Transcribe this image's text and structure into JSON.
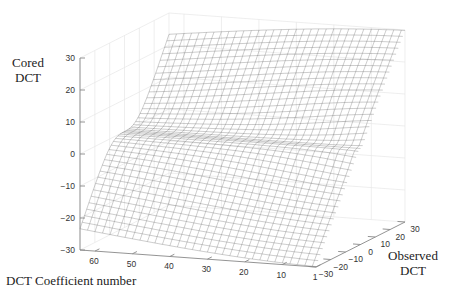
{
  "chart_data": {
    "type": "surface3d",
    "title": "",
    "zlabel": "Cored DCT",
    "xlabel": "DCT Coefficient number",
    "ylabel": "Observed DCT",
    "z_ticks": [
      30,
      20,
      10,
      0,
      -10,
      -20,
      -30
    ],
    "z_tick_labels": [
      "30",
      "20",
      "10",
      "0",
      "−10",
      "−20",
      "−30"
    ],
    "x_ticks": [
      60,
      50,
      40,
      30,
      20,
      10,
      1
    ],
    "x_tick_labels": [
      "60",
      "50",
      "40",
      "30",
      "20",
      "10",
      "1"
    ],
    "y_ticks": [
      -30,
      -20,
      -10,
      0,
      10,
      20,
      30
    ],
    "y_tick_labels": [
      "−30",
      "−20",
      "−10",
      "0",
      "10",
      "20",
      "30"
    ],
    "zlim": [
      -30,
      30
    ],
    "xlim": [
      1,
      64
    ],
    "ylim": [
      -30,
      30
    ],
    "grid": true,
    "legend": null,
    "style": "wireframe mesh, grayscale",
    "visible_ridges_count": 8
  },
  "labels": {
    "z_axis_title_line1": "Cored",
    "z_axis_title_line2": "DCT",
    "x_axis_title": "DCT Coefficient number",
    "y_axis_title_line1": "Observed",
    "y_axis_title_line2": "DCT"
  },
  "colors": {
    "background": "#ffffff",
    "axis": "#888888",
    "mesh": "#4a4a4a",
    "grid": "#e6e6e6",
    "text": "#333333"
  }
}
